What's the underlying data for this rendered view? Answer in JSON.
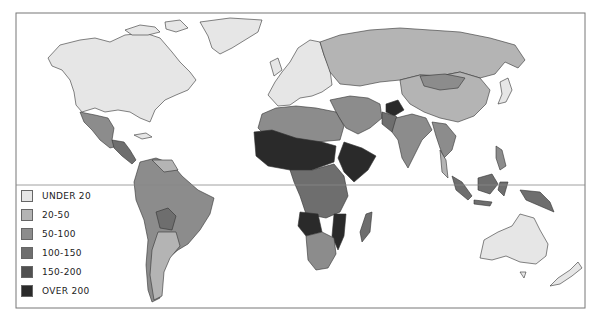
{
  "map": {
    "type": "choropleth world map",
    "legend": {
      "items": [
        {
          "label": "UNDER 20",
          "color": "#e6e6e6"
        },
        {
          "label": "20-50",
          "color": "#b4b4b4"
        },
        {
          "label": "50-100",
          "color": "#8c8c8c"
        },
        {
          "label": "100-150",
          "color": "#6e6e6e"
        },
        {
          "label": "150-200",
          "color": "#505050"
        },
        {
          "label": "OVER 200",
          "color": "#2a2a2a"
        }
      ]
    },
    "regions": [
      {
        "name": "North America (USA/Canada)",
        "class": "UNDER 20"
      },
      {
        "name": "Greenland",
        "class": "UNDER 20"
      },
      {
        "name": "Mexico",
        "class": "50-100"
      },
      {
        "name": "Central America",
        "class": "50-100"
      },
      {
        "name": "South America (Brazil etc.)",
        "class": "50-100"
      },
      {
        "name": "Bolivia",
        "class": "100-150"
      },
      {
        "name": "Argentina/Chile",
        "class": "20-50"
      },
      {
        "name": "Western Europe",
        "class": "UNDER 20"
      },
      {
        "name": "Russia",
        "class": "20-50"
      },
      {
        "name": "China",
        "class": "20-50"
      },
      {
        "name": "Mongolia",
        "class": "50-100"
      },
      {
        "name": "Japan",
        "class": "UNDER 20"
      },
      {
        "name": "North Africa",
        "class": "50-100"
      },
      {
        "name": "West/Central Africa (Sahel)",
        "class": "OVER 200"
      },
      {
        "name": "East Africa (Ethiopia)",
        "class": "OVER 200"
      },
      {
        "name": "Central Africa",
        "class": "100-150"
      },
      {
        "name": "Angola/Mozambique",
        "class": "OVER 200"
      },
      {
        "name": "Southern Africa",
        "class": "50-100"
      },
      {
        "name": "Madagascar",
        "class": "100-150"
      },
      {
        "name": "Middle East",
        "class": "50-100"
      },
      {
        "name": "Afghanistan",
        "class": "OVER 200"
      },
      {
        "name": "Pakistan",
        "class": "100-150"
      },
      {
        "name": "India",
        "class": "50-100"
      },
      {
        "name": "Southeast Asia",
        "class": "50-100"
      },
      {
        "name": "Indonesia",
        "class": "50-100"
      },
      {
        "name": "Papua New Guinea",
        "class": "50-100"
      },
      {
        "name": "Australia",
        "class": "UNDER 20"
      },
      {
        "name": "New Zealand",
        "class": "UNDER 20"
      }
    ]
  }
}
